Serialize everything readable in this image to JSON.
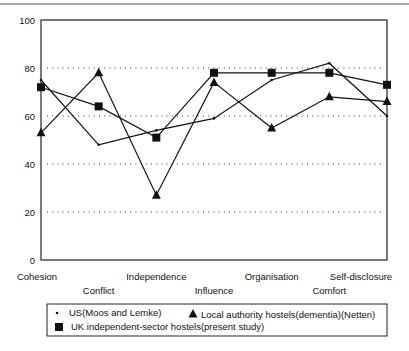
{
  "chart_data": {
    "type": "line",
    "title": "",
    "xlabel": "",
    "ylabel": "",
    "ylim": [
      0,
      100
    ],
    "yticks": [
      0,
      20,
      40,
      60,
      80,
      100
    ],
    "grid": {
      "horizontal_dotted": [
        20,
        40,
        60,
        80
      ]
    },
    "categories": [
      "Cohesion",
      "Conflict",
      "Independence",
      "Influence",
      "Organisation",
      "Comfort",
      "Self-disclosure"
    ],
    "series": [
      {
        "name": "US(Moos and Lemke)",
        "marker": "dot",
        "values": [
          75,
          48,
          54,
          59,
          75,
          82,
          60
        ]
      },
      {
        "name": "Local authority hostels(dementia)(Netten)",
        "marker": "triangle",
        "values": [
          53,
          78,
          27,
          74,
          55,
          68,
          66
        ]
      },
      {
        "name": "UK independent-sector hostels(present study)",
        "marker": "square",
        "values": [
          72,
          64,
          51,
          78,
          78,
          78,
          73
        ]
      }
    ],
    "legend": {
      "position": "bottom",
      "rows": [
        [
          "US(Moos and Lemke)",
          "Local authority hostels(dementia)(Netten)"
        ],
        [
          "UK independent-sector hostels(present study)"
        ]
      ]
    }
  }
}
